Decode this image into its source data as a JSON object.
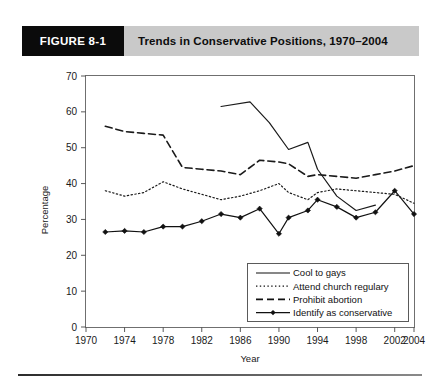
{
  "header": {
    "figure_number": "FIGURE 8-1",
    "title": "Trends in Conservative Positions, 1970–2004",
    "banner_color": "#c9c9c9",
    "number_box_color": "#0b0b0b"
  },
  "chart_data": {
    "type": "line",
    "title": "Trends in Conservative Positions, 1970–2004",
    "xlabel": "Year",
    "ylabel": "Percentage",
    "xlim": [
      1970,
      2004
    ],
    "ylim": [
      0,
      70
    ],
    "xticks": [
      1970,
      1974,
      1978,
      1982,
      1986,
      1990,
      1994,
      1998,
      2002,
      2004
    ],
    "xtick_labels": [
      "1970",
      "1974",
      "1978",
      "1982",
      "1986",
      "1990",
      "1994",
      "1998",
      "2002",
      "2004"
    ],
    "yticks": [
      0,
      10,
      20,
      30,
      40,
      50,
      60,
      70
    ],
    "ytick_labels": [
      "0",
      "10",
      "20",
      "30",
      "40",
      "50",
      "60",
      "70"
    ],
    "grid": false,
    "legend_position": "lower-right",
    "series": [
      {
        "name": "Cool to gays",
        "style": "solid",
        "marker": "none",
        "color": "#1a1a1a",
        "x": [
          1984,
          1987,
          1989,
          1991,
          1993,
          1994,
          1996,
          1998,
          2000
        ],
        "values": [
          61.5,
          62.8,
          57.0,
          49.5,
          51.5,
          44.0,
          36.5,
          32.5,
          34.0
        ]
      },
      {
        "name": "Attend church regulary",
        "style": "dotted",
        "marker": "none",
        "color": "#1a1a1a",
        "x": [
          1972,
          1974,
          1976,
          1978,
          1980,
          1982,
          1984,
          1986,
          1988,
          1990,
          1991,
          1993,
          1994,
          1996,
          1998,
          2000,
          2002,
          2004
        ],
        "values": [
          38.0,
          36.5,
          37.5,
          40.5,
          38.5,
          37.0,
          35.5,
          36.5,
          38.0,
          40.0,
          37.5,
          35.5,
          37.5,
          38.5,
          38.0,
          37.5,
          37.0,
          34.5
        ]
      },
      {
        "name": "Prohibit abortion",
        "style": "dashed",
        "marker": "none",
        "color": "#1a1a1a",
        "x": [
          1972,
          1974,
          1976,
          1978,
          1980,
          1982,
          1984,
          1986,
          1988,
          1990,
          1991,
          1993,
          1994,
          1996,
          1998,
          2000,
          2002,
          2004
        ],
        "values": [
          56.0,
          54.5,
          54.0,
          53.5,
          44.5,
          44.0,
          43.5,
          42.5,
          46.5,
          46.0,
          45.5,
          42.0,
          42.5,
          42.0,
          41.5,
          42.5,
          43.5,
          45.0
        ]
      },
      {
        "name": "Identify as conservative",
        "style": "solid",
        "marker": "diamond",
        "color": "#111111",
        "x": [
          1972,
          1974,
          1976,
          1978,
          1980,
          1982,
          1984,
          1986,
          1988,
          1990,
          1991,
          1993,
          1994,
          1996,
          1998,
          2000,
          2002,
          2004
        ],
        "values": [
          26.5,
          26.8,
          26.5,
          28.0,
          28.0,
          29.5,
          31.5,
          30.5,
          33.0,
          26.0,
          30.5,
          32.5,
          35.5,
          33.5,
          30.5,
          32.0,
          38.0,
          31.5
        ]
      }
    ]
  },
  "legend": {
    "items": [
      {
        "label": "Cool to gays",
        "style": "solid",
        "marker": "none"
      },
      {
        "label": "Attend church regulary",
        "style": "dotted",
        "marker": "none"
      },
      {
        "label": "Prohibit abortion",
        "style": "dashed",
        "marker": "none"
      },
      {
        "label": "Identify as conservative",
        "style": "solid",
        "marker": "diamond"
      }
    ]
  }
}
